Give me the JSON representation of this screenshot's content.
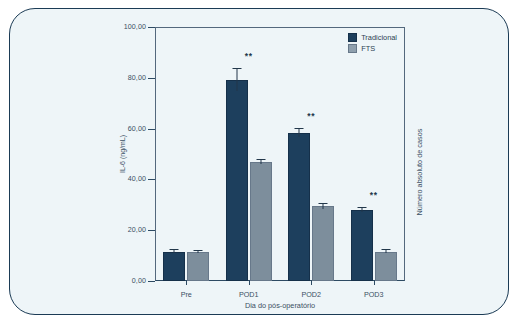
{
  "chart_data": {
    "type": "bar",
    "title": "",
    "xlabel": "Dia do pós-operatório",
    "ylabel": "IL-6 (ng/mL)",
    "right_axis_label": "Número absoluto de casos",
    "categories": [
      "Pre",
      "POD1",
      "POD2",
      "POD3"
    ],
    "ylim": [
      0,
      100
    ],
    "yticks": [
      0,
      20,
      40,
      60,
      80,
      100
    ],
    "ytick_labels": [
      "0,00",
      "20,00",
      "40,00",
      "60,00",
      "80,00",
      "100,00"
    ],
    "grid": false,
    "legend_position": "top-right",
    "series": [
      {
        "name": "Tradicional",
        "color": "#1d3f5d",
        "values": [
          11.5,
          79.3,
          58.4,
          28.0
        ],
        "errors": [
          0.6,
          4.3,
          1.6,
          0.7
        ]
      },
      {
        "name": "FTS",
        "color": "#7d8e9c",
        "values": [
          11.5,
          46.8,
          29.5,
          11.6
        ],
        "errors": [
          0.5,
          0.8,
          1.0,
          0.5
        ]
      }
    ],
    "annotations": [
      {
        "category": "Pre",
        "text": ""
      },
      {
        "category": "POD1",
        "text": "**"
      },
      {
        "category": "POD2",
        "text": "**"
      },
      {
        "category": "POD3",
        "text": "**"
      }
    ]
  },
  "colors": {
    "panel_background": "#eef5f8",
    "panel_border": "#1b3b55",
    "axis": "#2d4a63",
    "text": "#3a4f63",
    "series_traditional": "#1d3f5d",
    "series_fts": "#7d8e9c"
  }
}
